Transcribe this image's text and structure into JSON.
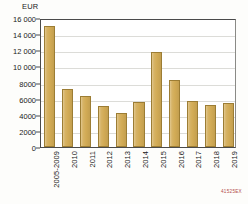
{
  "chart_data": {
    "type": "bar",
    "title": "",
    "xlabel": "",
    "ylabel": "EUR",
    "unit_label": "EUR",
    "ylim": [
      0,
      16000
    ],
    "ytick_step": 2000,
    "yticks": [
      0,
      2000,
      4000,
      6000,
      8000,
      10000,
      12000,
      14000,
      16000
    ],
    "ytick_labels": [
      "0",
      "2000",
      "4000",
      "6000",
      "8000",
      "10 000",
      "12 000",
      "14 000",
      "16 000"
    ],
    "grid": true,
    "legend": "none",
    "bar_color": "#d2ab55",
    "bar_border_color": "#9c7d34",
    "categories": [
      "2005-2009",
      "2010",
      "2011",
      "2012",
      "2013",
      "2014",
      "2015",
      "2016",
      "2017",
      "2018",
      "2019"
    ],
    "values": [
      15000,
      7200,
      6300,
      5100,
      4200,
      5600,
      11800,
      8300,
      5700,
      5200,
      5500
    ]
  },
  "footer": {
    "code": "41525EX"
  }
}
